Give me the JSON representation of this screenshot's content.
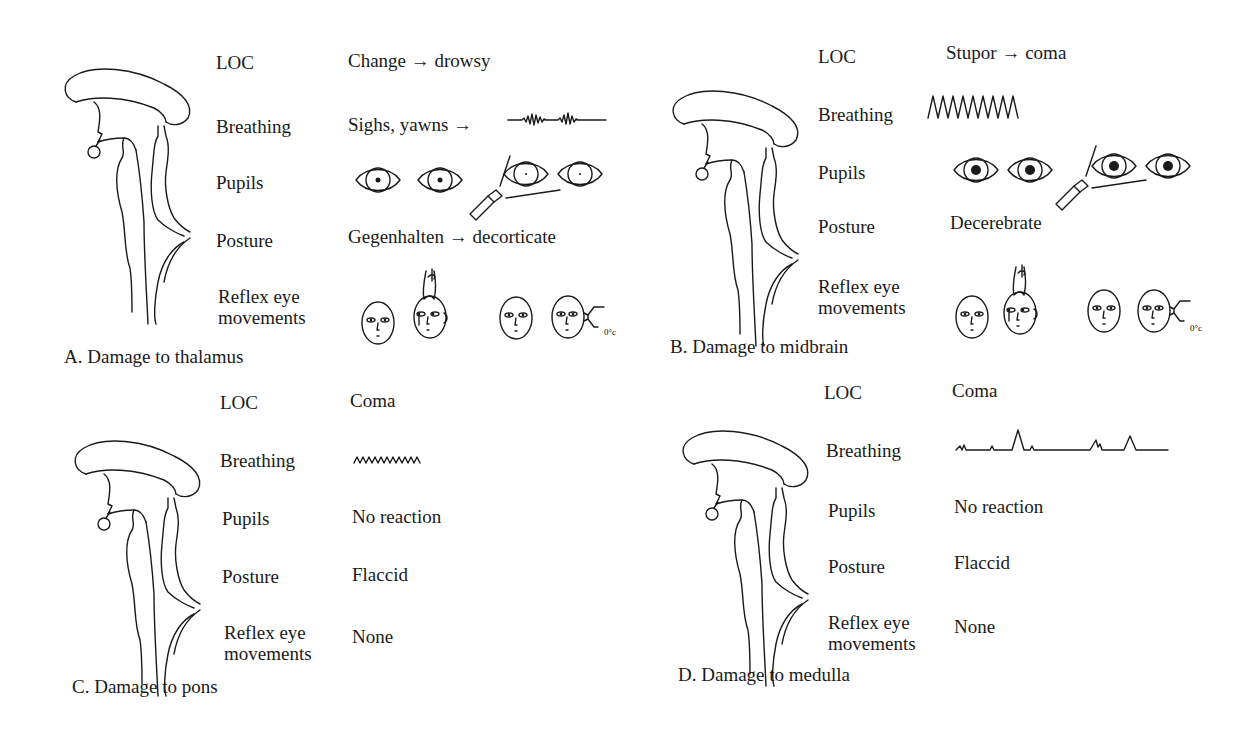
{
  "row_labels": {
    "loc": "LOC",
    "breathing": "Breathing",
    "pupils": "Pupils",
    "posture": "Posture",
    "reflex_line1": "Reflex eye",
    "reflex_line2": "movements"
  },
  "panels": [
    {
      "id": "A",
      "caption": "A. Damage to thalamus",
      "loc": "Change → drowsy",
      "breathing_text": "Sighs, yawns →",
      "breathing_pattern": "cheyne-stokes",
      "pupils_graphic": "small-reactive",
      "posture": "Gegenhalten → decorticate",
      "reflex_graphic": "intact-oculocephalic-caloric",
      "caloric_label": "0°c"
    },
    {
      "id": "B",
      "caption": "B. Damage to midbrain",
      "loc": "Stupor → coma",
      "breathing_pattern": "central-hyperventilation",
      "pupils_graphic": "midposition-fixed",
      "posture": "Decerebrate",
      "reflex_graphic": "impaired-oculocephalic-caloric",
      "caloric_label": "0°c"
    },
    {
      "id": "C",
      "caption": "C. Damage to pons",
      "loc": "Coma",
      "breathing_pattern": "shallow-rapid",
      "pupils": "No reaction",
      "posture": "Flaccid",
      "reflex": "None"
    },
    {
      "id": "D",
      "caption": "D. Damage to medulla",
      "loc": "Coma",
      "breathing_pattern": "ataxic",
      "pupils": "No reaction",
      "posture": "Flaccid",
      "reflex": "None"
    }
  ]
}
